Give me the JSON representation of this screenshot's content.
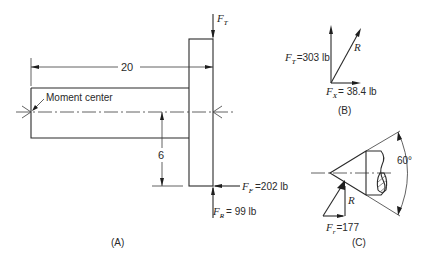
{
  "figure": {
    "panels": [
      {
        "id": "A",
        "label": "(A)",
        "annotations": {
          "moment_center": "Moment center",
          "length_dim": "20",
          "offset_dim": "6"
        },
        "forces": {
          "ft": {
            "symbol": "F",
            "sub": "T",
            "value": ""
          },
          "ff": {
            "symbol": "F",
            "sub": "F",
            "value": "=202 lb"
          },
          "fr": {
            "symbol": "F",
            "sub": "R",
            "value": "= 99 lb"
          }
        }
      },
      {
        "id": "B",
        "label": "(B)",
        "forces": {
          "ft": {
            "symbol": "F",
            "sub": "T",
            "value": "=303 lb"
          },
          "fx": {
            "symbol": "F",
            "sub": "X",
            "value": "= 38.4 lb"
          },
          "r": {
            "symbol": "R"
          }
        }
      },
      {
        "id": "C",
        "label": "(C)",
        "angle": "60°",
        "forces": {
          "fr": {
            "symbol": "F",
            "sub": "r",
            "value": "=177"
          },
          "r": {
            "symbol": "R"
          }
        }
      }
    ],
    "colors": {
      "line": "#2a2a2a",
      "background": "#ffffff"
    }
  }
}
